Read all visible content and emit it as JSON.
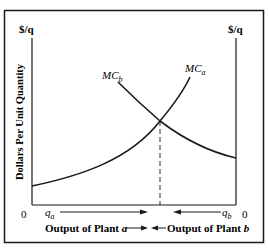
{
  "figure": {
    "left_axis_label": "$/q",
    "right_axis_label": "$/q",
    "y_axis_title": "Dollars Per Unit Quantity",
    "origin_left": "0",
    "origin_right": "0",
    "qa_label": "q",
    "qa_sub": "a",
    "qb_label": "q",
    "qb_sub": "b",
    "output_a_label": "Output of Plant ",
    "output_a_var": "a",
    "output_b_label": "Output of Plant ",
    "output_b_var": "b",
    "curves": [
      {
        "name": "MC",
        "sub": "b",
        "description": "Marginal cost of plant b, decreasing left to right"
      },
      {
        "name": "MC",
        "sub": "a",
        "description": "Marginal cost of plant a, increasing left to right"
      }
    ],
    "colors": {
      "line": "#1a1a1a",
      "background": "#ffffff"
    }
  }
}
